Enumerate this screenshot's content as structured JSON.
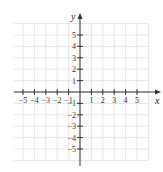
{
  "chart_data": {
    "type": "scatter",
    "title": "",
    "xlabel": "x",
    "ylabel": "y",
    "xlim": [
      -6,
      6
    ],
    "ylim": [
      -6,
      6
    ],
    "grid": true,
    "x_ticks": [
      -5,
      -4,
      -3,
      -2,
      -1,
      1,
      2,
      3,
      4,
      5
    ],
    "y_ticks": [
      5,
      4,
      3,
      2,
      1,
      -1,
      -2,
      -3,
      -4,
      -5
    ],
    "x_tick_labels": [
      "−5",
      "−4",
      "−3",
      "−2",
      "−1",
      "1",
      "2",
      "3",
      "4",
      "5"
    ],
    "y_tick_labels": [
      "5",
      "4",
      "3",
      "2",
      "1",
      "−1",
      "−2",
      "−3",
      "−4",
      "−5"
    ],
    "series": []
  },
  "colors": {
    "grid": "#e6e6e6",
    "axis": "#333333",
    "background": "#ffffff"
  }
}
